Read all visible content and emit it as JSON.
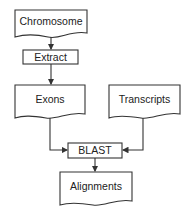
{
  "diagram": {
    "type": "flowchart",
    "nodes": {
      "chromosome": {
        "label": "Chromosome",
        "shape": "document"
      },
      "extract": {
        "label": "Extract",
        "shape": "process"
      },
      "exons": {
        "label": "Exons",
        "shape": "document"
      },
      "transcripts": {
        "label": "Transcripts",
        "shape": "document"
      },
      "blast": {
        "label": "BLAST",
        "shape": "process"
      },
      "alignments": {
        "label": "Alignments",
        "shape": "document"
      }
    },
    "edges": [
      {
        "from": "Chromosome",
        "to": "Extract"
      },
      {
        "from": "Extract",
        "to": "Exons"
      },
      {
        "from": "Exons",
        "to": "BLAST"
      },
      {
        "from": "Transcripts",
        "to": "BLAST"
      },
      {
        "from": "BLAST",
        "to": "Alignments"
      }
    ],
    "colors": {
      "stroke": "#333333",
      "text": "#222222",
      "background": "#ffffff"
    }
  }
}
